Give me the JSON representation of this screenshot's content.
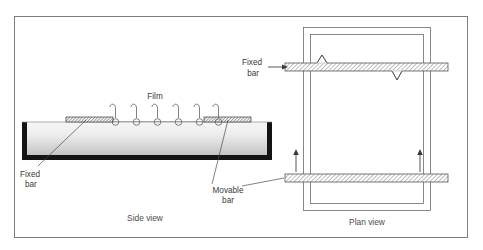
{
  "figure": {
    "title": "",
    "border_color": "#7d7d7d",
    "background": "#ffffff"
  },
  "side_view": {
    "caption": "Side view",
    "film_label": "Film",
    "fixed_bar_label_line1": "Fixed",
    "fixed_bar_label_line2": "bar",
    "movable_bar_label_line1": "Movable",
    "movable_bar_label_line2": "bar",
    "hook_count": 6,
    "trough_fill_top": "#f2f2f2",
    "trough_fill_bottom": "#c9c9c9",
    "trough_wall_color": "#1a1a1a"
  },
  "plan_view": {
    "caption": "Plan view",
    "fixed_bar_label_line1": "Fixed",
    "fixed_bar_label_line2": "bar",
    "arrow_count": 2,
    "hatch_color": "#5a5a5a",
    "frame_color": "#6b6b6b"
  },
  "colors": {
    "line": "#5a5a5a",
    "text": "#3a3a3a",
    "border": "#7d7d7d"
  }
}
